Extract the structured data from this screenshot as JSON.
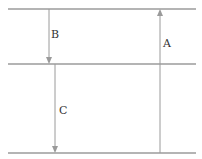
{
  "diagram": {
    "levels": [
      {
        "name": "top-level",
        "y": 9
      },
      {
        "name": "middle-level",
        "y": 64
      },
      {
        "name": "bottom-level",
        "y": 153
      }
    ],
    "arrows": [
      {
        "label": "B",
        "direction": "down",
        "from": "top-level",
        "to": "middle-level"
      },
      {
        "label": "C",
        "direction": "down",
        "from": "middle-level",
        "to": "bottom-level"
      },
      {
        "label": "A",
        "direction": "up",
        "from": "bottom-level",
        "to": "top-level"
      }
    ],
    "colors": {
      "line": "#6b6b6b",
      "arrow": "#9a9a9a",
      "text": "#333333"
    }
  }
}
